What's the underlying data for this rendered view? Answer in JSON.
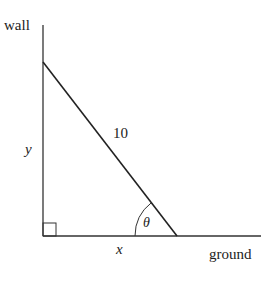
{
  "diagram": {
    "labels": {
      "wall": "wall",
      "ground": "ground",
      "hypotenuse": "10",
      "height": "y",
      "base": "x",
      "angle": "θ"
    },
    "colors": {
      "stroke": "#333333",
      "text": "#222222",
      "background": "#ffffff"
    }
  }
}
